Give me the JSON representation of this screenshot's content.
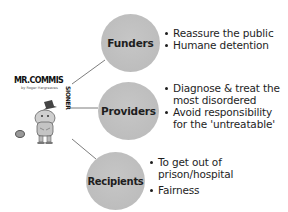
{
  "logo": {
    "title_horizontal": "MR.COMMIS",
    "title_vertical": "SIONER",
    "subtitle": "by Roger Hargreaves",
    "icon": "mr-commissioner-illustration"
  },
  "nodes": [
    {
      "id": "funders",
      "label": "Funders",
      "fill": "#bdbdbd",
      "bullets": [
        "Reassure the public",
        "Humane detention"
      ]
    },
    {
      "id": "providers",
      "label": "Providers",
      "fill": "#bdbdbd",
      "bullets": [
        "Diagnose & treat the",
        "most disordered",
        "Avoid responsibility",
        "for the 'untreatable'"
      ]
    },
    {
      "id": "recipients",
      "label": "Recipients",
      "fill": "#bdbdbd",
      "bullets": [
        "To get out of",
        "prison/hospital",
        "Fairness"
      ]
    }
  ],
  "colors": {
    "background": "#ffffff",
    "node_fill": "#bdbdbd",
    "connector": "#6e6e6e",
    "text": "#1e1e1e"
  }
}
